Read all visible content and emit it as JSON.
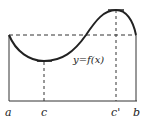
{
  "diagram": {
    "function_label": "y=f(x)",
    "axis_labels": {
      "a": "a",
      "c": "c",
      "c_prime": "c'",
      "b": "b"
    },
    "colors": {
      "curve": "#222222",
      "lines": "#333333",
      "background": "#ffffff"
    }
  }
}
